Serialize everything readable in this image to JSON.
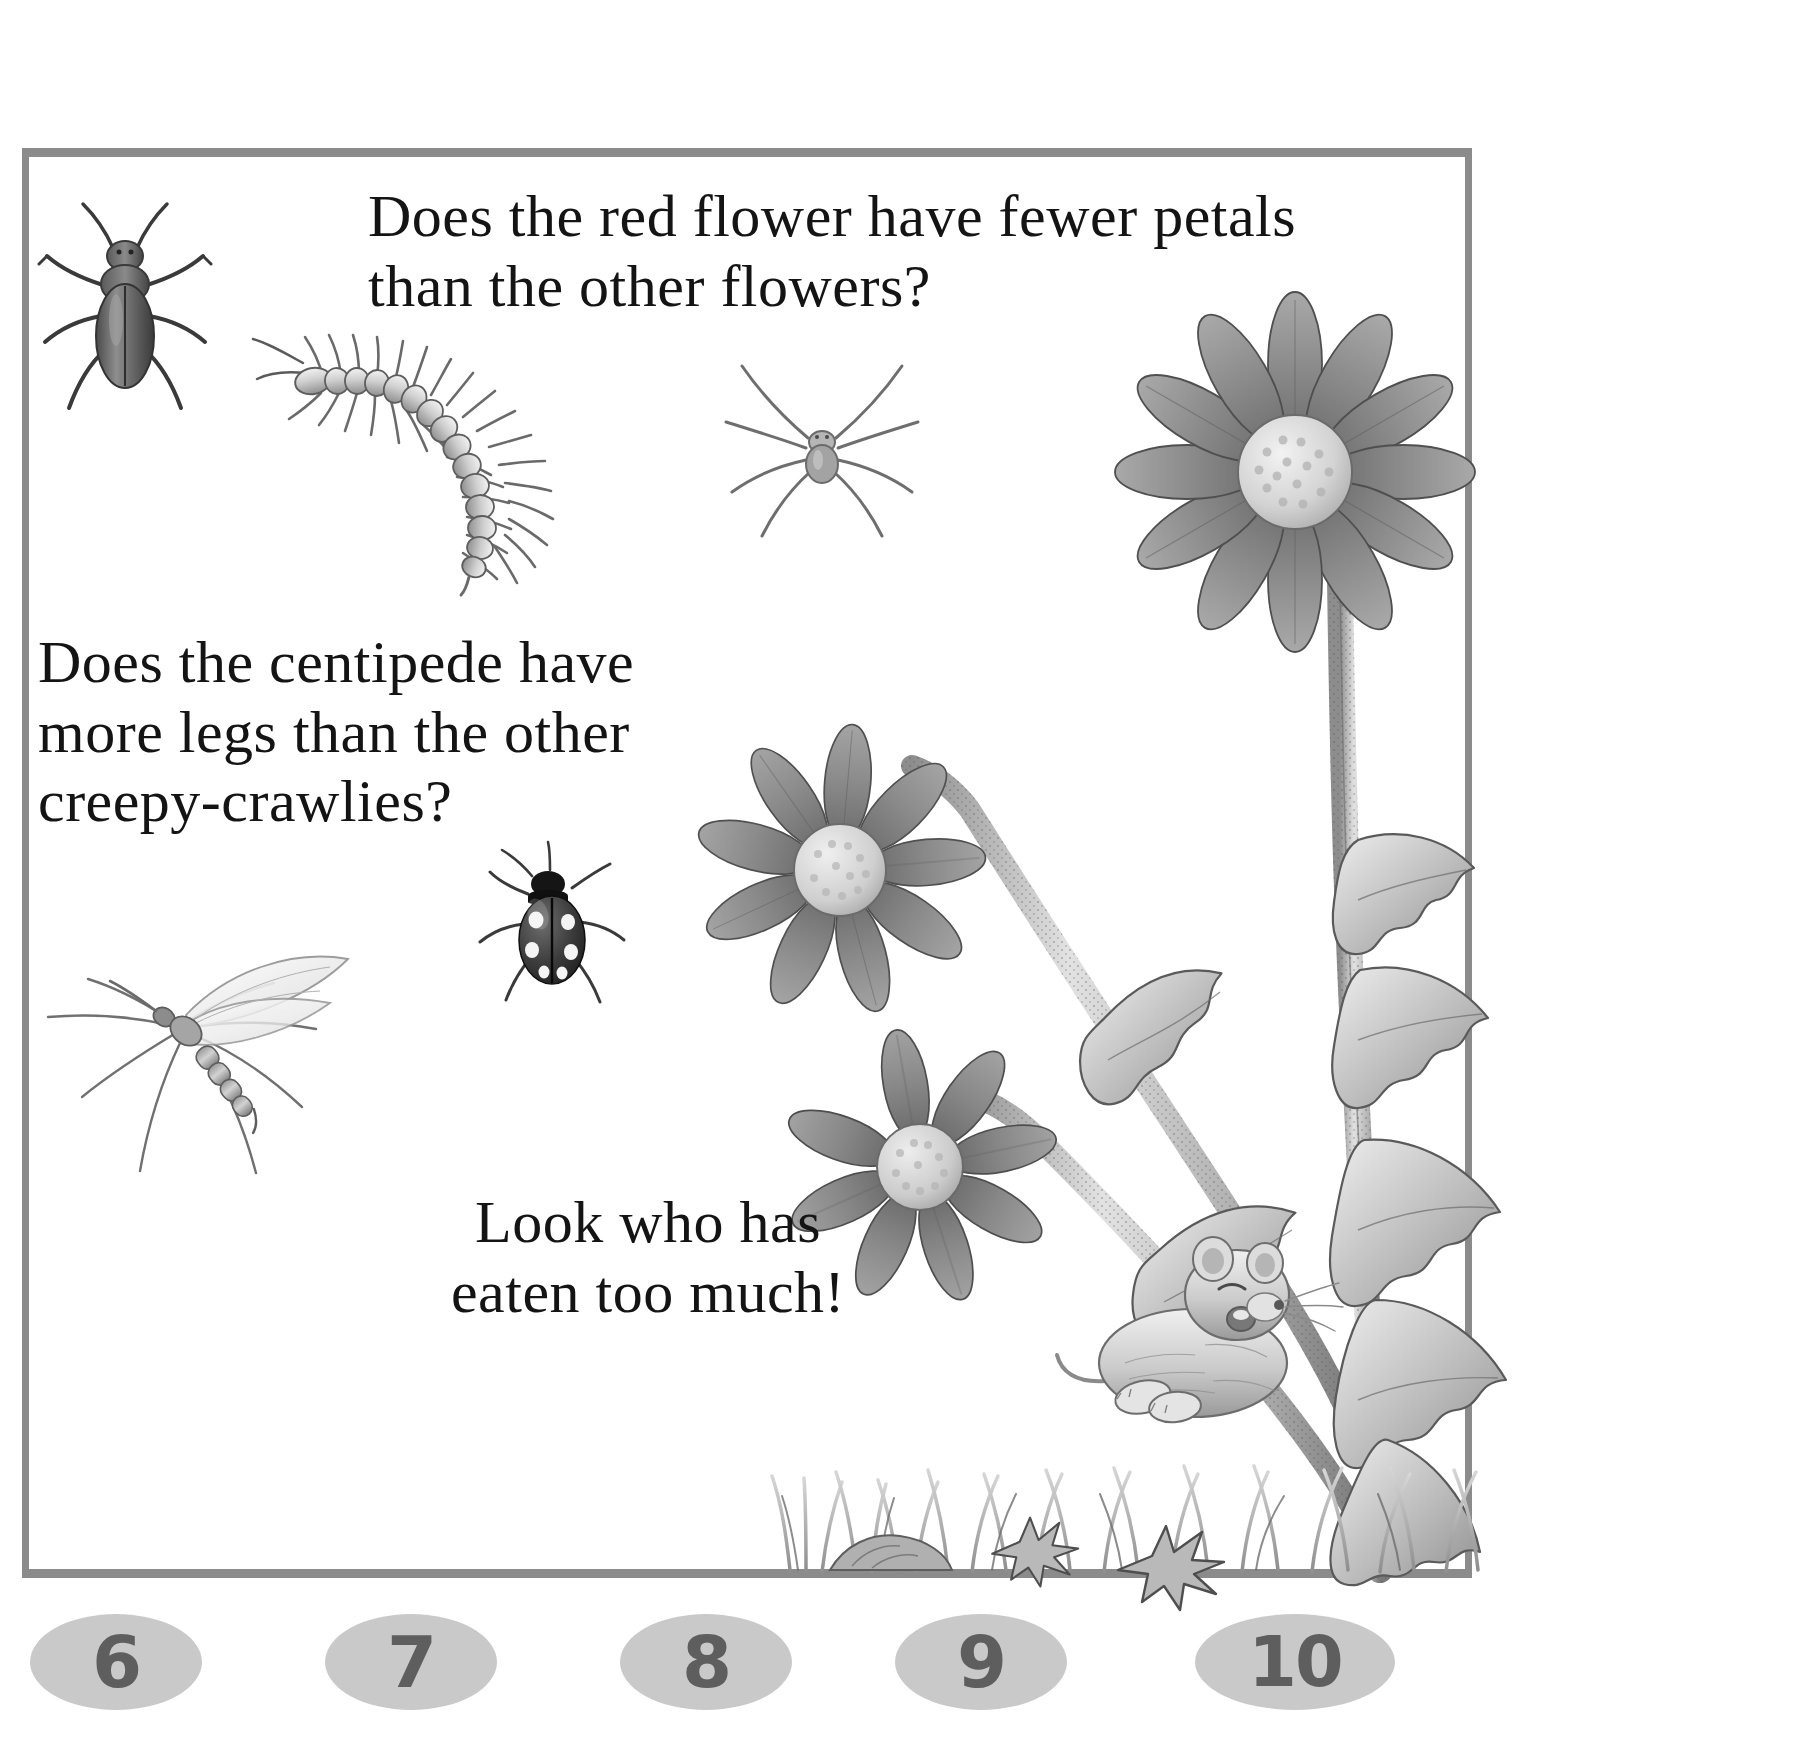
{
  "page": {
    "type": "childrens-counting-book-page",
    "background_color": "#ffffff",
    "frame_color": "#8b8b8b"
  },
  "questions": {
    "q1": "Does the red flower have fewer petals\nthan the other flowers?",
    "q2": "Does the centipede have\nmore legs than the other\ncreepy-crawlies?",
    "q3": "Look who has\neaten too much!"
  },
  "numbers": {
    "badge_fill": "#c9c9c9",
    "badge_text_color": "#5e5e5e",
    "items": [
      {
        "label": "6",
        "x": 30
      },
      {
        "label": "7",
        "x": 325
      },
      {
        "label": "8",
        "x": 620
      },
      {
        "label": "9",
        "x": 895
      },
      {
        "label": "10",
        "x": 1195
      }
    ]
  },
  "illustrations": {
    "beetle": {
      "name": "beetle",
      "x": 28,
      "y": 195
    },
    "centipede": {
      "name": "centipede",
      "x": 250,
      "y": 330
    },
    "spider": {
      "name": "spider",
      "x": 715,
      "y": 335
    },
    "mosquito": {
      "name": "mosquito",
      "x": 35,
      "y": 880
    },
    "ladybird": {
      "name": "ladybird",
      "x": 470,
      "y": 845
    },
    "flower_top": {
      "name": "daisy-flower-top",
      "x": 1110,
      "y": 310
    },
    "flower_middle": {
      "name": "daisy-flower-middle",
      "x": 690,
      "y": 745
    },
    "flower_bottom": {
      "name": "daisy-flower-bottom",
      "x": 780,
      "y": 1045
    },
    "plant_stems": {
      "name": "thistle-plant-stems",
      "x": 880,
      "y": 560
    },
    "mouse": {
      "name": "sleeping-mouse",
      "x": 1060,
      "y": 1195
    },
    "grass": {
      "name": "grass-ground",
      "x": 770,
      "y": 1280
    }
  }
}
